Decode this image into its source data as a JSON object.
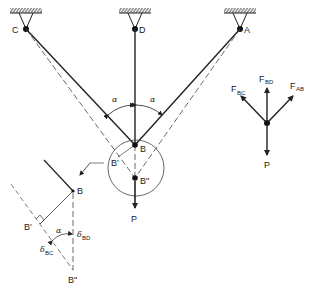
{
  "diagram": {
    "supports": [
      {
        "label": "C",
        "x": 26,
        "y": 29
      },
      {
        "label": "D",
        "x": 135,
        "y": 29
      },
      {
        "label": "A",
        "x": 240,
        "y": 29
      }
    ],
    "joint": {
      "label": "B",
      "displaced_label": "B\"",
      "projected_label": "B'"
    },
    "load": {
      "label": "P"
    },
    "angle": {
      "symbol": "α"
    },
    "free_body": {
      "forces": [
        {
          "label": "F",
          "sub": "BC"
        },
        {
          "label": "F",
          "sub": "BD"
        },
        {
          "label": "F",
          "sub": "AB"
        }
      ],
      "load_label": "P"
    },
    "detail": {
      "B": "B",
      "B_prime": "B'",
      "B_double_prime": "B\"",
      "alpha": "α",
      "delta_BD": {
        "symbol": "δ",
        "sub": "BD"
      },
      "delta_BC": {
        "symbol": "δ",
        "sub": "BC"
      }
    }
  }
}
